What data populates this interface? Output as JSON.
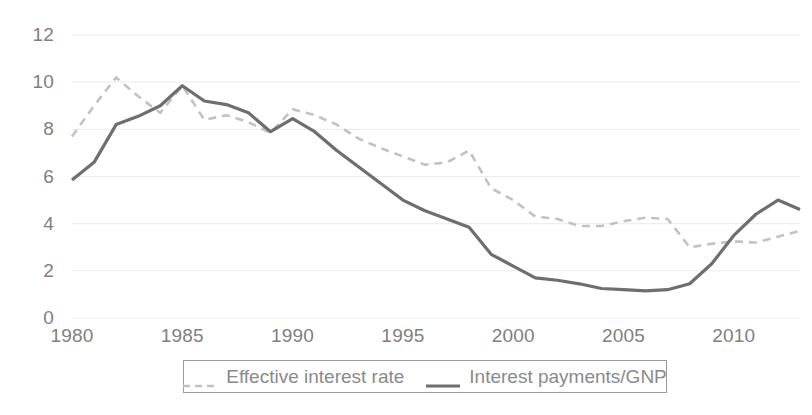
{
  "chart_data": {
    "type": "line",
    "title": "",
    "subtitle": "",
    "xlabel": "",
    "ylabel": "",
    "xlim": [
      1980,
      2013
    ],
    "ylim": [
      0,
      12
    ],
    "grid": true,
    "legend_position": "bottom",
    "y_ticks": [
      "0",
      "2",
      "4",
      "6",
      "8",
      "10",
      "12"
    ],
    "y_tick_values": [
      0,
      2,
      4,
      6,
      8,
      10,
      12
    ],
    "x_ticks": [
      "1980",
      "1985",
      "1990",
      "1995",
      "2000",
      "2005",
      "2010"
    ],
    "x_tick_values": [
      1980,
      1985,
      1990,
      1995,
      2000,
      2005,
      2010
    ],
    "x": [
      1980,
      1981,
      1982,
      1983,
      1984,
      1985,
      1986,
      1987,
      1988,
      1989,
      1990,
      1991,
      1992,
      1993,
      1994,
      1995,
      1996,
      1997,
      1998,
      1999,
      2000,
      2001,
      2002,
      2003,
      2004,
      2005,
      2006,
      2007,
      2008,
      2009,
      2010,
      2011,
      2012,
      2013
    ],
    "series": [
      {
        "name": "Effective interest rate",
        "style": "dashed",
        "color": "#c2c2c2",
        "values": [
          7.7,
          9.0,
          10.2,
          9.4,
          8.7,
          9.85,
          8.4,
          8.6,
          8.3,
          7.85,
          8.85,
          8.6,
          8.2,
          7.6,
          7.2,
          6.85,
          6.5,
          6.6,
          7.1,
          5.5,
          5.0,
          4.3,
          4.2,
          3.9,
          3.9,
          4.1,
          4.25,
          4.2,
          3.0,
          3.15,
          3.25,
          3.2,
          3.45,
          3.7
        ]
      },
      {
        "name": "Interest payments/GNP",
        "style": "solid",
        "color": "#6e6e6e",
        "values": [
          5.85,
          6.6,
          8.2,
          8.55,
          9.0,
          9.85,
          9.2,
          9.05,
          8.7,
          7.9,
          8.45,
          7.9,
          7.1,
          6.4,
          5.7,
          5.0,
          4.55,
          4.2,
          3.85,
          2.7,
          2.2,
          1.7,
          1.6,
          1.45,
          1.25,
          1.2,
          1.15,
          1.2,
          1.45,
          2.3,
          3.5,
          4.4,
          5.0,
          4.6
        ]
      }
    ]
  },
  "legend": {
    "entries": [
      {
        "label": "Effective interest rate",
        "icon": "dashed-line-swatch"
      },
      {
        "label": "Interest payments/GNP",
        "icon": "solid-line-swatch"
      }
    ]
  },
  "colors": {
    "background": "#ffffff",
    "gridline": "#ebebeb",
    "tick_text": "#808080",
    "legend_border": "#9a9a9a",
    "legend_text": "#8a8a8a",
    "series_dashed": "#c2c2c2",
    "series_solid": "#6e6e6e"
  }
}
